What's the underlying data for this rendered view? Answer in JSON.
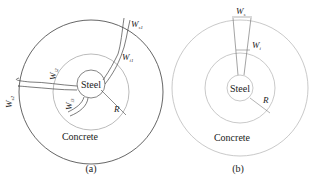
{
  "panels": [
    {
      "id": "a",
      "caption": "(a)",
      "material_inner": "Steel",
      "material_outer": "Concrete",
      "radius_label": "R",
      "crack_width_labels": [
        {
          "main": "W",
          "sub": "s1"
        },
        {
          "main": "W",
          "sub": "i1"
        },
        {
          "main": "W",
          "sub": "s2"
        },
        {
          "main": "W",
          "sub": "i2"
        },
        {
          "main": "W",
          "sub": "i3"
        }
      ]
    },
    {
      "id": "b",
      "caption": "(b)",
      "material_inner": "Steel",
      "material_outer": "Concrete",
      "radius_label": "R",
      "crack_width_labels": [
        {
          "main": "W",
          "sub": "s"
        },
        {
          "main": "W",
          "sub": "i"
        }
      ]
    }
  ],
  "colors": {
    "outer_circle_a": "#555555",
    "outer_circle_b": "#bbbbbb",
    "inner_circles": "#aaaaaa",
    "crack_lines": "#444444"
  }
}
